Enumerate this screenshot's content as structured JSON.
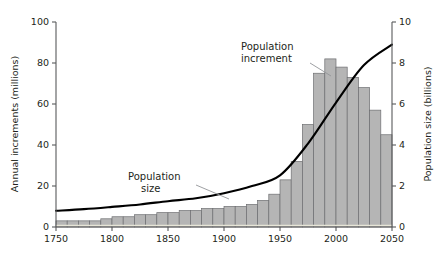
{
  "chart_data": {
    "type": "bar",
    "title": "",
    "subtitle": "",
    "xlabel": "",
    "ylabel": "Annual increments (millions)",
    "y2label": "Population size (billions)",
    "xlim": [
      1750,
      2050
    ],
    "ylim": [
      0,
      100
    ],
    "y2lim": [
      0,
      10
    ],
    "grid": false,
    "legend": "none",
    "xtick_labels": [
      "1750",
      "1800",
      "1850",
      "1900",
      "1950",
      "2000",
      "2050"
    ],
    "xtick_values": [
      1750,
      1800,
      1850,
      1900,
      1950,
      2000,
      2050
    ],
    "ytick_labels": [
      "0",
      "20",
      "40",
      "60",
      "80",
      "100"
    ],
    "ytick_values": [
      0,
      20,
      40,
      60,
      80,
      100
    ],
    "y2tick_labels": [
      "0",
      "2",
      "4",
      "6",
      "8",
      "10"
    ],
    "y2tick_values": [
      0,
      2,
      4,
      6,
      8,
      10
    ],
    "bar_series": {
      "name": "Population increment",
      "axis": "left",
      "units": "millions per year",
      "bin_width": 10,
      "bin_starts": [
        1750,
        1760,
        1770,
        1780,
        1790,
        1800,
        1810,
        1820,
        1830,
        1840,
        1850,
        1860,
        1870,
        1880,
        1890,
        1900,
        1910,
        1920,
        1930,
        1940,
        1950,
        1960,
        1970,
        1980,
        1990,
        2000,
        2010,
        2020,
        2030,
        2040
      ],
      "values": [
        3,
        3,
        3,
        3,
        4,
        5,
        5,
        6,
        6,
        7,
        7,
        8,
        8,
        9,
        9,
        10,
        10,
        11,
        13,
        16,
        23,
        32,
        50,
        75,
        82,
        78,
        73,
        68,
        57,
        45
      ]
    },
    "line_series": {
      "name": "Population size",
      "axis": "right",
      "units": "billions",
      "x": [
        1750,
        1775,
        1800,
        1825,
        1850,
        1875,
        1900,
        1925,
        1950,
        1975,
        2000,
        2025,
        2050
      ],
      "values": [
        0.79,
        0.87,
        0.98,
        1.1,
        1.26,
        1.4,
        1.65,
        2.0,
        2.52,
        4.07,
        6.07,
        7.9,
        8.9
      ]
    },
    "annotations": [
      {
        "name": "population-increment",
        "lines": [
          "Population",
          "increment"
        ],
        "text": "Population increment",
        "points_to_x": 1980
      },
      {
        "name": "population-size",
        "lines": [
          "Population",
          "size"
        ],
        "text": "Population size",
        "points_to_x": 1895
      }
    ],
    "colors": {
      "bar_fill": "#b5b5b5",
      "bar_stroke": "#6d6e71",
      "line": "#000000",
      "axis": "#58595b",
      "text": "#231f20",
      "leader": "#939598",
      "background": "#ffffff"
    }
  }
}
